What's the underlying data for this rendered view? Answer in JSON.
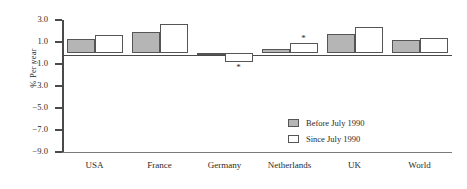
{
  "chart_data": {
    "type": "bar",
    "title": "",
    "xlabel": "",
    "ylabel": "% Per year",
    "categories": [
      "USA",
      "France",
      "Germany",
      "Netherlands",
      "UK",
      "World"
    ],
    "series": [
      {
        "name": "Before July 1990",
        "color": "#b5b5b5",
        "values": [
          1.3,
          1.9,
          -0.2,
          0.35,
          1.7,
          1.15
        ]
      },
      {
        "name": "Since July 1990",
        "color": "#ffffff",
        "values": [
          1.65,
          2.6,
          -0.8,
          0.95,
          2.35,
          1.4
        ]
      }
    ],
    "ylim": [
      -9.0,
      3.0
    ],
    "yticks": [
      "3.0",
      "1.0",
      "-1.0",
      "-3.0",
      "-5.0",
      "-7.0",
      "-9.0"
    ],
    "ytick_values": [
      3.0,
      1.0,
      -1.0,
      -3.0,
      -5.0,
      -7.0,
      -9.0
    ],
    "grid": false,
    "legend_position": "inside-lower-right",
    "annotations": [
      {
        "label": "*",
        "category": "Germany",
        "series": "Since July 1990",
        "placement": "below-bar"
      },
      {
        "label": "*",
        "category": "Netherlands",
        "series": "Since July 1990",
        "placement": "above-bar"
      }
    ]
  },
  "legend": {
    "items": [
      {
        "label": "Before July 1990",
        "swatch": "filled-gray"
      },
      {
        "label": "Since July 1990",
        "swatch": "open-white"
      }
    ]
  }
}
